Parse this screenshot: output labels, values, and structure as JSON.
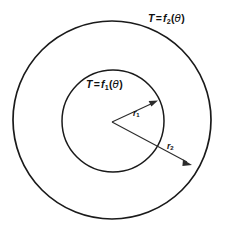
{
  "figure": {
    "type": "annulus-boundary-condition-diagram",
    "background_color": "#ffffff",
    "stroke_color": "#1a1a1a",
    "labels": {
      "outer_boundary": {
        "name": "outer-boundary-condition-label",
        "var": "T",
        "eq": "=",
        "fn": "f",
        "sub": "2",
        "open_paren": "(",
        "theta": "θ",
        "close_paren": ")",
        "full_text": "T = f2(θ)"
      },
      "inner_boundary": {
        "name": "inner-boundary-condition-label",
        "var": "T",
        "eq": "=",
        "fn": "f",
        "sub": "1",
        "open_paren": "(",
        "theta": "θ",
        "close_paren": ")",
        "full_text": "T = f1(θ)"
      },
      "inner_radius": {
        "name": "inner-radius-label",
        "symbol": "r",
        "sub": "1",
        "full_text": "r1"
      },
      "outer_radius": {
        "name": "outer-radius-label",
        "symbol": "r",
        "sub": "2",
        "full_text": "r2"
      }
    },
    "geometry": {
      "center": {
        "x": 112,
        "y": 121
      },
      "outer_circle": {
        "cx": 112,
        "cy": 120,
        "r": 99,
        "stroke_width": 1.7
      },
      "inner_circle": {
        "cx": 113,
        "cy": 121,
        "r": 51,
        "stroke_width": 1.5
      },
      "inner_radius_arrow": {
        "x1": 112,
        "y1": 122,
        "x2": 157,
        "y2": 101
      },
      "outer_radius_arrow": {
        "x1": 112,
        "y1": 122,
        "x2": 191,
        "y2": 165
      }
    }
  }
}
